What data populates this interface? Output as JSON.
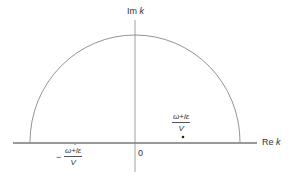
{
  "diagram": {
    "type": "contour-integral",
    "axes": {
      "imaginary": {
        "label_prefix": "Im",
        "label_var": "k"
      },
      "real": {
        "label_prefix": "Re",
        "label_var": "k"
      },
      "origin": "0"
    },
    "contour": {
      "shape": "upper-semicircle",
      "closed_along": "real-axis"
    },
    "poles": [
      {
        "numerator": "ω+iε",
        "denominator": "V",
        "sign": "",
        "position": "upper-half-plane",
        "marked": true
      },
      {
        "numerator": "ω+iε",
        "denominator": "V",
        "sign": "−",
        "position": "below-real-axis",
        "marked": false
      }
    ],
    "colors": {
      "lines": "#777777",
      "axis": "#666666",
      "text": "#333333",
      "background": "#ffffff"
    }
  }
}
